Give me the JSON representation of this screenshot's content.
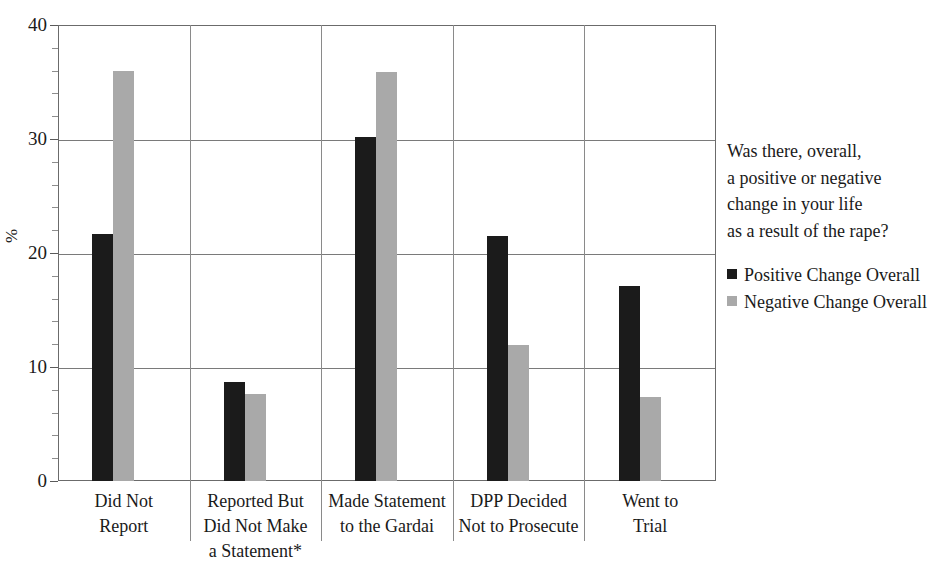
{
  "chart_data": {
    "type": "bar",
    "title": "",
    "xlabel": "",
    "ylabel": "%",
    "ylim": [
      0,
      40
    ],
    "y_ticks": [
      0,
      10,
      20,
      30,
      40
    ],
    "y_minor_tick_step": 2,
    "grid": true,
    "legend_position": "right",
    "legend_title_lines": [
      "Was there, overall,",
      "a positive or negative",
      "change in your life",
      "as a result of the rape?"
    ],
    "categories": [
      "Did Not Report",
      "Reported But Did Not Make a Statement*",
      "Made Statement to the Gardai",
      "DPP Decided Not to Prosecute",
      "Went to Trial"
    ],
    "category_label_lines": [
      [
        "Did Not",
        "Report"
      ],
      [
        "Reported But",
        "Did Not Make",
        "a Statement*"
      ],
      [
        "Made Statement",
        "to the Gardai"
      ],
      [
        "DPP Decided",
        "Not to Prosecute"
      ],
      [
        "Went to",
        "Trial"
      ]
    ],
    "series": [
      {
        "name": "Positive Change Overall",
        "color": "#1b1b1b",
        "values": [
          21.7,
          8.7,
          30.2,
          21.5,
          17.1
        ]
      },
      {
        "name": "Negative Change Overall",
        "color": "#a9a9a9",
        "values": [
          36.0,
          7.6,
          35.9,
          11.9,
          7.4
        ]
      }
    ]
  },
  "colors": {
    "positive": "#1b1b1b",
    "negative": "#a9a9a9",
    "axis": "#6b6b6b",
    "grid": "#7a7a7a",
    "background": "#ffffff"
  }
}
